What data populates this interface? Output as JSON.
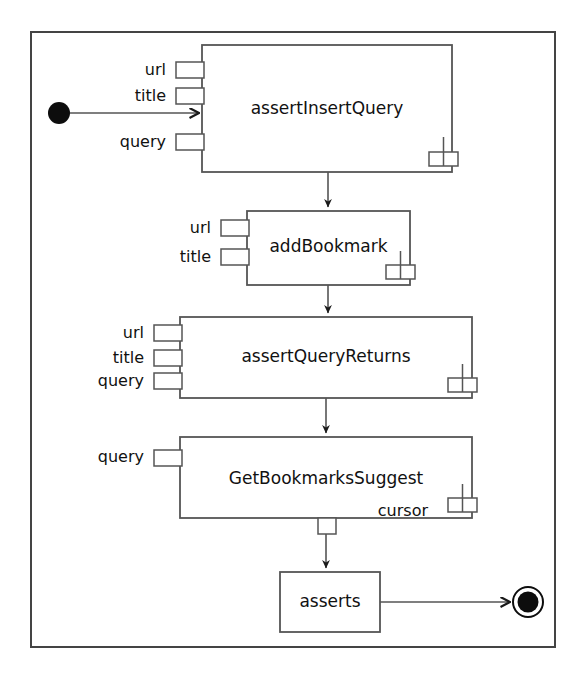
{
  "diagram": {
    "type": "uml-activity-diagram",
    "frame": {
      "x": 30,
      "y": 31,
      "width": 526,
      "height": 617,
      "stroke": "#3a3a3a",
      "stroke_width": 2
    },
    "background": "#ffffff",
    "line_color": "#555555",
    "text_color": "#111111",
    "nodes": {
      "initial": {
        "name": "initial-node",
        "cx": 59,
        "cy": 113,
        "r": 11
      },
      "final": {
        "name": "activity-final-node",
        "cx": 528,
        "cy": 602,
        "r_outer": 15,
        "r_inner": 10
      }
    },
    "actions": [
      {
        "id": "assertInsertQuery",
        "label": "assertInsertQuery",
        "x": 202,
        "y": 45,
        "width": 250,
        "height": 127,
        "label_x": 327,
        "label_y": 109,
        "rake": true,
        "input_pins": [
          {
            "label": "url",
            "pin_y": 70,
            "label_x": 161,
            "label_y": 70
          },
          {
            "label": "title",
            "pin_y": 96,
            "label_x": 161,
            "label_y": 96
          },
          {
            "label": "query",
            "pin_y": 142,
            "label_x": 161,
            "label_y": 142
          }
        ],
        "output_pins": []
      },
      {
        "id": "addBookmark",
        "label": "addBookmark",
        "x": 247,
        "y": 211,
        "width": 163,
        "height": 74,
        "label_x": 328,
        "label_y": 245,
        "rake": true,
        "input_pins": [
          {
            "label": "url",
            "pin_y": 228,
            "label_x": 206,
            "label_y": 228
          },
          {
            "label": "title",
            "pin_y": 257,
            "label_x": 206,
            "label_y": 257
          }
        ],
        "output_pins": []
      },
      {
        "id": "assertQueryReturns",
        "label": "assertQueryReturns",
        "x": 180,
        "y": 317,
        "width": 292,
        "height": 81,
        "label_x": 326,
        "label_y": 356,
        "rake": true,
        "input_pins": [
          {
            "label": "url",
            "pin_y": 333,
            "label_x": 139,
            "label_y": 333
          },
          {
            "label": "title",
            "pin_y": 358,
            "label_x": 139,
            "label_y": 358
          },
          {
            "label": "query",
            "pin_y": 381,
            "label_x": 139,
            "label_y": 381
          }
        ],
        "output_pins": []
      },
      {
        "id": "GetBookmarksSuggest",
        "label": "GetBookmarksSuggest",
        "x": 180,
        "y": 437,
        "width": 292,
        "height": 81,
        "label_x": 326,
        "label_y": 478,
        "rake": true,
        "inner_label": {
          "text": "cursor",
          "x": 424,
          "y": 511
        },
        "input_pins": [
          {
            "label": "query",
            "pin_y": 457,
            "label_x": 139,
            "label_y": 457
          }
        ],
        "output_pins": [
          {
            "label": "",
            "pin_x": 326
          }
        ]
      },
      {
        "id": "asserts",
        "label": "asserts",
        "x": 280,
        "y": 572,
        "width": 100,
        "height": 60,
        "label_x": 330,
        "label_y": 602,
        "rake": false,
        "input_pins": [],
        "output_pins": []
      }
    ],
    "edges": [
      {
        "from": "initial-node",
        "to": "assertInsertQuery",
        "orientation": "horizontal",
        "x1": 70,
        "y1": 113,
        "x2": 202,
        "y2": 113
      },
      {
        "from": "assertInsertQuery",
        "to": "addBookmark",
        "orientation": "vertical",
        "x1": 328,
        "y1": 172,
        "x2": 328,
        "y2": 211
      },
      {
        "from": "addBookmark",
        "to": "assertQueryReturns",
        "orientation": "vertical",
        "x1": 328,
        "y1": 285,
        "x2": 328,
        "y2": 317
      },
      {
        "from": "assertQueryReturns",
        "to": "GetBookmarksSuggest",
        "orientation": "vertical",
        "x1": 326,
        "y1": 398,
        "x2": 326,
        "y2": 437
      },
      {
        "from": "GetBookmarksSuggest",
        "to": "asserts",
        "orientation": "vertical",
        "x1": 326,
        "y1": 530,
        "x2": 326,
        "y2": 572
      },
      {
        "from": "asserts",
        "to": "activity-final-node",
        "orientation": "horizontal",
        "x1": 380,
        "y1": 602,
        "x2": 513,
        "y2": 602
      }
    ]
  }
}
